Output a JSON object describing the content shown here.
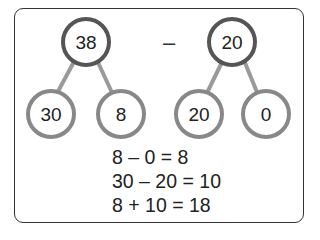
{
  "diagram": {
    "operation_symbol": "–",
    "trees": [
      {
        "top": "38",
        "left": "30",
        "right": "8"
      },
      {
        "top": "20",
        "left": "20",
        "right": "0"
      }
    ],
    "equations": [
      "8 – 0 = 8",
      "30 – 20 = 10",
      "8 + 10 = 18"
    ],
    "colors": {
      "circle_stroke": "#555555",
      "branch": "#9a9a9a",
      "frame": "#333333"
    }
  }
}
